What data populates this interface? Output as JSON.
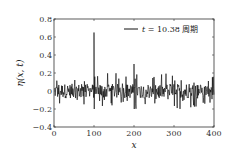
{
  "chart_data": {
    "type": "line",
    "title": "",
    "xlabel": "x",
    "ylabel": "η(x, t)",
    "xlim": [
      0,
      400
    ],
    "ylim": [
      -0.4,
      0.8
    ],
    "xticks": [
      0,
      100,
      200,
      300,
      400
    ],
    "xtick_labels": [
      "0",
      "100",
      "200",
      "300",
      "400"
    ],
    "yticks": [
      -0.4,
      -0.2,
      0,
      0.2,
      0.4,
      0.6,
      0.8
    ],
    "ytick_labels": [
      "−0.4",
      "−0.2",
      "0",
      "0.2",
      "0.4",
      "0.6",
      "0.8"
    ],
    "grid": false,
    "legend": {
      "position": "upper right",
      "entries": [
        "t = 10.38 周期"
      ]
    },
    "series": [
      {
        "name": "t = 10.38 周期",
        "color": "#000000",
        "description": "Noisy signal fluctuating roughly within ±0.2 around 0, with a sharp spike of ~0.65 at x=100 and a secondary spike of ~0.3 at x=200",
        "spikes": [
          {
            "x": 100,
            "y": 0.65
          },
          {
            "x": 100,
            "y": -0.2
          },
          {
            "x": 200,
            "y": 0.3
          },
          {
            "x": 200,
            "y": -0.2
          }
        ],
        "noise_amplitude": 0.2
      }
    ]
  },
  "legend": {
    "label_var": "t",
    "label_eq": " = 10.38 ",
    "label_unit": "周期"
  },
  "axes": {
    "xlabel": "x",
    "ylabel": "η(x, t)"
  }
}
